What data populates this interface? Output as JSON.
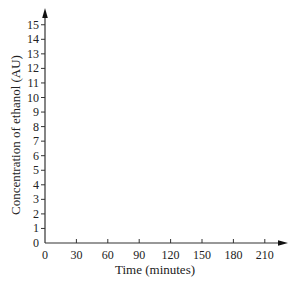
{
  "chart_data": {
    "type": "line",
    "title": "",
    "xlabel": "Time (minutes)",
    "ylabel": "Concentration of ethanol (AU)",
    "x_ticks": [
      "0",
      "30",
      "60",
      "90",
      "120",
      "150",
      "180",
      "210"
    ],
    "y_ticks": [
      "0",
      "1",
      "2",
      "3",
      "4",
      "5",
      "6",
      "7",
      "8",
      "9",
      "10",
      "11",
      "12",
      "13",
      "14",
      "15"
    ],
    "xlim": [
      0,
      225
    ],
    "ylim": [
      0,
      15.5
    ],
    "series": [],
    "grid": false,
    "legend": null,
    "note": "Empty axes with no plotted data"
  },
  "colors": {
    "axis": "#333333",
    "text": "#222222",
    "background": "#ffffff"
  }
}
